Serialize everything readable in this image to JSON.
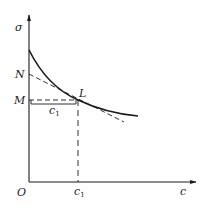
{
  "diagram": {
    "type": "stress-concentration curve with tangent",
    "axes": {
      "y_label": "σ",
      "x_label": "c",
      "origin_label": "O"
    },
    "points": {
      "N": "N",
      "M": "M",
      "L": "L"
    },
    "brace_label": {
      "base": "c",
      "sub": "1"
    },
    "x_tick_label": {
      "base": "c",
      "sub": "1"
    },
    "colors": {
      "stroke": "#1a1a1a",
      "text": "#222222",
      "background": "#ffffff"
    }
  }
}
